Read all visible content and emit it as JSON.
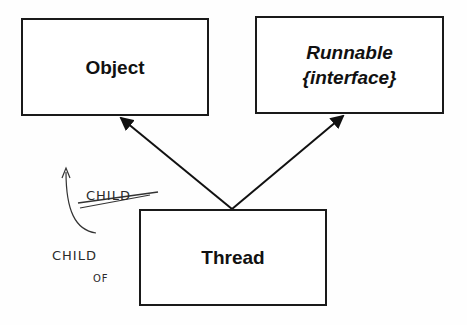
{
  "diagram": {
    "type": "class-inheritance",
    "nodes": [
      {
        "id": "object",
        "label": "Object",
        "style": "bold"
      },
      {
        "id": "runnable",
        "label": "Runnable",
        "sublabel": "{interface}",
        "style": "bold-italic"
      },
      {
        "id": "thread",
        "label": "Thread",
        "style": "bold"
      }
    ],
    "edges": [
      {
        "from": "thread",
        "to": "object",
        "arrow": "filled-triangle"
      },
      {
        "from": "thread",
        "to": "runnable",
        "arrow": "filled-triangle"
      }
    ],
    "annotations": {
      "struck_text": "CHILD",
      "handwritten_line1": "CHILD",
      "handwritten_line2": "OF"
    }
  }
}
